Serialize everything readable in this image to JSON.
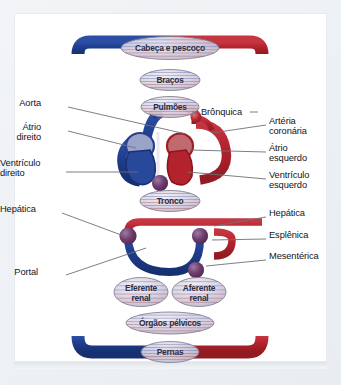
{
  "diagram": {
    "language": "pt-BR",
    "colors": {
      "venous_blue": "#1f3d8c",
      "arterial_red": "#b2222c",
      "node_blue": "#2b4a9b",
      "node_red": "#bb2a33",
      "label_text": "#111418",
      "leader_line": "#6d7178",
      "organ_label_text": "#2b2f45",
      "frame": "#eef1f5",
      "page_background": "#ffffff"
    },
    "organ_nodes": [
      {
        "id": "cabeca-e-pescoco",
        "label": "Cabeça e pescoço",
        "cx": 170,
        "cy": 48,
        "rx": 49,
        "ry": 11.5
      },
      {
        "id": "bracos",
        "label": "Braços",
        "cx": 170,
        "cy": 80,
        "rx": 30,
        "ry": 10.5
      },
      {
        "id": "pulmoes",
        "label": "Pulmões",
        "cx": 170,
        "cy": 107,
        "rx": 29,
        "ry": 10.5
      },
      {
        "id": "tronco",
        "label": "Tronco",
        "cx": 170,
        "cy": 201,
        "rx": 30,
        "ry": 10.5
      },
      {
        "id": "eferente-renal",
        "label": "Eferente\nrenal",
        "cx": 141,
        "cy": 292,
        "rx": 27,
        "ry": 14.5
      },
      {
        "id": "aferente-renal",
        "label": "Aferente\nrenal",
        "cx": 199,
        "cy": 292,
        "rx": 27,
        "ry": 14.5
      },
      {
        "id": "orgaos-pelvicos",
        "label": "Órgãos pélvicos",
        "cx": 170,
        "cy": 323,
        "rx": 44,
        "ry": 11
      },
      {
        "id": "pernas",
        "label": "Pernas",
        "cx": 170,
        "cy": 352,
        "rx": 29,
        "ry": 10.5
      }
    ],
    "labels_left": [
      {
        "id": "aorta",
        "text": "Aorta",
        "x": 41,
        "y": 103
      },
      {
        "id": "atrio-direito",
        "text": "Átrio\ndireito",
        "x": 41,
        "y": 127
      },
      {
        "id": "ventriculo-direito",
        "text": "Ventrículo\ndireito",
        "x": 18,
        "y": 163
      },
      {
        "id": "hepatica-esquerda",
        "text": "Hepática",
        "x": 22,
        "y": 209
      },
      {
        "id": "portal",
        "text": "Portal",
        "x": 38,
        "y": 272
      }
    ],
    "labels_right": [
      {
        "id": "bronquica",
        "text": "Brônquica",
        "x": 201,
        "y": 112
      },
      {
        "id": "arteria-coronaria",
        "text": "Artéria\ncoronária",
        "x": 269,
        "y": 121
      },
      {
        "id": "atrio-esquerdo",
        "text": "Átrio\nesquerdo",
        "x": 269,
        "y": 148
      },
      {
        "id": "ventriculo-esquerdo",
        "text": "Ventrículo\nesquerdo",
        "x": 269,
        "y": 175
      },
      {
        "id": "hepatica-direita",
        "text": "Hepática",
        "x": 269,
        "y": 213
      },
      {
        "id": "esplenica",
        "text": "Esplênica",
        "x": 269,
        "y": 235
      },
      {
        "id": "mesenterica",
        "text": "Mesentérica",
        "x": 269,
        "y": 256
      }
    ]
  }
}
